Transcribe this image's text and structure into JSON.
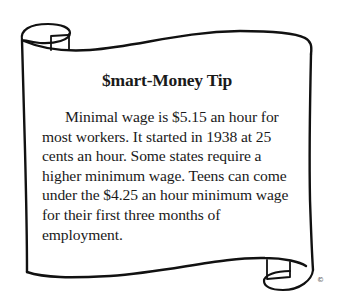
{
  "tip": {
    "title": "$mart-Money Tip",
    "body": "Minimal wage is $5.15 an hour for most workers. It started in 1938 at 25 cents an hour. Some states require a higher minimum wage. Teens can come under the $4.25 an hour minimum wage for their first three months of employment."
  },
  "footer": {
    "copyright_symbol": "©"
  },
  "colors": {
    "ink": "#1a1a1a",
    "paper": "#ffffff"
  }
}
